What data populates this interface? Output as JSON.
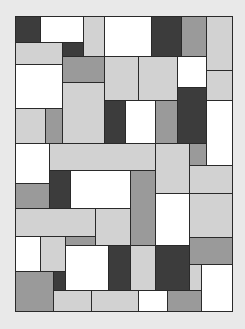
{
  "artwork": {
    "type": "rectangle-grid",
    "background": "#e9e9e9",
    "line_color": "#2a2a2a",
    "bounds": {
      "x": 15,
      "y": 16,
      "w": 217,
      "h": 295
    },
    "palette": {
      "white": "#ffffff",
      "light": "#d2d2d2",
      "mid": "#9a9a9a",
      "dark": "#3c3c3c"
    },
    "blocks": [
      {
        "x": 15,
        "y": 16,
        "w": 25,
        "h": 26,
        "c": "dark"
      },
      {
        "x": 40,
        "y": 16,
        "w": 43,
        "h": 26,
        "c": "white"
      },
      {
        "x": 83,
        "y": 16,
        "w": 21,
        "h": 40,
        "c": "light"
      },
      {
        "x": 104,
        "y": 16,
        "w": 47,
        "h": 40,
        "c": "white"
      },
      {
        "x": 151,
        "y": 16,
        "w": 30,
        "h": 40,
        "c": "dark"
      },
      {
        "x": 181,
        "y": 16,
        "w": 25,
        "h": 40,
        "c": "mid"
      },
      {
        "x": 206,
        "y": 16,
        "w": 26,
        "h": 54,
        "c": "light"
      },
      {
        "x": 15,
        "y": 42,
        "w": 47,
        "h": 22,
        "c": "light"
      },
      {
        "x": 62,
        "y": 42,
        "w": 21,
        "h": 14,
        "c": "dark"
      },
      {
        "x": 62,
        "y": 56,
        "w": 42,
        "h": 26,
        "c": "mid"
      },
      {
        "x": 104,
        "y": 56,
        "w": 34,
        "h": 44,
        "c": "light"
      },
      {
        "x": 138,
        "y": 56,
        "w": 39,
        "h": 44,
        "c": "light"
      },
      {
        "x": 177,
        "y": 56,
        "w": 29,
        "h": 31,
        "c": "white"
      },
      {
        "x": 206,
        "y": 70,
        "w": 26,
        "h": 30,
        "c": "light"
      },
      {
        "x": 15,
        "y": 64,
        "w": 47,
        "h": 44,
        "c": "white"
      },
      {
        "x": 62,
        "y": 82,
        "w": 42,
        "h": 61,
        "c": "light"
      },
      {
        "x": 177,
        "y": 87,
        "w": 29,
        "h": 56,
        "c": "dark"
      },
      {
        "x": 15,
        "y": 108,
        "w": 30,
        "h": 35,
        "c": "light"
      },
      {
        "x": 45,
        "y": 108,
        "w": 17,
        "h": 35,
        "c": "mid"
      },
      {
        "x": 104,
        "y": 100,
        "w": 21,
        "h": 43,
        "c": "dark"
      },
      {
        "x": 125,
        "y": 100,
        "w": 30,
        "h": 43,
        "c": "white"
      },
      {
        "x": 155,
        "y": 100,
        "w": 22,
        "h": 43,
        "c": "mid"
      },
      {
        "x": 206,
        "y": 100,
        "w": 26,
        "h": 65,
        "c": "white"
      },
      {
        "x": 15,
        "y": 143,
        "w": 34,
        "h": 40,
        "c": "white"
      },
      {
        "x": 49,
        "y": 143,
        "w": 106,
        "h": 27,
        "c": "light"
      },
      {
        "x": 155,
        "y": 143,
        "w": 34,
        "h": 50,
        "c": "light"
      },
      {
        "x": 189,
        "y": 143,
        "w": 17,
        "h": 22,
        "c": "mid"
      },
      {
        "x": 189,
        "y": 165,
        "w": 43,
        "h": 28,
        "c": "light"
      },
      {
        "x": 15,
        "y": 183,
        "w": 34,
        "h": 25,
        "c": "mid"
      },
      {
        "x": 49,
        "y": 170,
        "w": 21,
        "h": 38,
        "c": "dark"
      },
      {
        "x": 70,
        "y": 170,
        "w": 60,
        "h": 38,
        "c": "white"
      },
      {
        "x": 130,
        "y": 170,
        "w": 25,
        "h": 75,
        "c": "mid"
      },
      {
        "x": 155,
        "y": 193,
        "w": 34,
        "h": 52,
        "c": "white"
      },
      {
        "x": 189,
        "y": 193,
        "w": 43,
        "h": 44,
        "c": "light"
      },
      {
        "x": 15,
        "y": 208,
        "w": 80,
        "h": 28,
        "c": "light"
      },
      {
        "x": 95,
        "y": 208,
        "w": 35,
        "h": 37,
        "c": "light"
      },
      {
        "x": 15,
        "y": 236,
        "w": 25,
        "h": 35,
        "c": "white"
      },
      {
        "x": 40,
        "y": 236,
        "w": 25,
        "h": 35,
        "c": "light"
      },
      {
        "x": 65,
        "y": 236,
        "w": 30,
        "h": 9,
        "c": "mid"
      },
      {
        "x": 65,
        "y": 245,
        "w": 43,
        "h": 45,
        "c": "white"
      },
      {
        "x": 108,
        "y": 245,
        "w": 22,
        "h": 45,
        "c": "dark"
      },
      {
        "x": 130,
        "y": 245,
        "w": 25,
        "h": 45,
        "c": "light"
      },
      {
        "x": 155,
        "y": 245,
        "w": 34,
        "h": 45,
        "c": "dark"
      },
      {
        "x": 189,
        "y": 237,
        "w": 43,
        "h": 27,
        "c": "mid"
      },
      {
        "x": 189,
        "y": 264,
        "w": 12,
        "h": 26,
        "c": "light"
      },
      {
        "x": 201,
        "y": 264,
        "w": 31,
        "h": 47,
        "c": "white"
      },
      {
        "x": 15,
        "y": 271,
        "w": 38,
        "h": 40,
        "c": "mid"
      },
      {
        "x": 53,
        "y": 271,
        "w": 12,
        "h": 19,
        "c": "dark"
      },
      {
        "x": 53,
        "y": 290,
        "w": 38,
        "h": 21,
        "c": "light"
      },
      {
        "x": 91,
        "y": 290,
        "w": 47,
        "h": 21,
        "c": "light"
      },
      {
        "x": 138,
        "y": 290,
        "w": 29,
        "h": 21,
        "c": "white"
      },
      {
        "x": 167,
        "y": 290,
        "w": 34,
        "h": 21,
        "c": "mid"
      }
    ]
  }
}
